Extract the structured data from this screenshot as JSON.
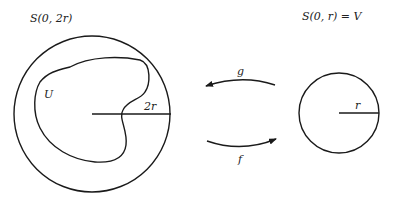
{
  "diagram": {
    "left_set": {
      "label": "S(0, 2r)",
      "radius_label": "2r",
      "region_label": "U"
    },
    "right_set": {
      "label": "S(0, r) = V",
      "radius_label": "r"
    },
    "maps": {
      "top_arrow_label": "g",
      "bottom_arrow_label": "f"
    },
    "colors": {
      "line": "#1a1a1a",
      "background": "#ffffff"
    }
  }
}
